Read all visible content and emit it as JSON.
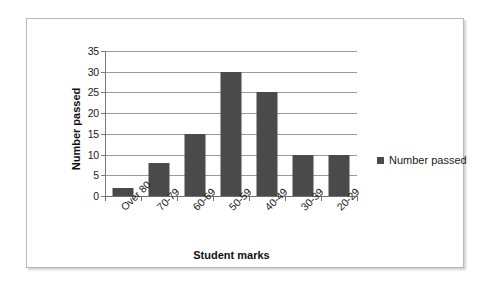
{
  "chart_data": {
    "type": "bar",
    "title": "",
    "xlabel": "Student marks",
    "ylabel": "Number passed",
    "categories": [
      "Over 80",
      "70-79",
      "60-69",
      "50-59",
      "40-49",
      "30-39",
      "20-29"
    ],
    "values": [
      2,
      8,
      15,
      30,
      25,
      10,
      10
    ],
    "series": [
      {
        "name": "Number passed",
        "values": [
          2,
          8,
          15,
          30,
          25,
          10,
          10
        ]
      }
    ],
    "ylim": [
      0,
      35
    ],
    "yticks": [
      0,
      5,
      10,
      15,
      20,
      25,
      30,
      35
    ],
    "ytick_labels": [
      "0",
      "5",
      "10",
      "15",
      "20",
      "25",
      "30",
      "35"
    ],
    "grid": "horizontal",
    "legend": {
      "position": "right",
      "entries": [
        "Number passed"
      ]
    },
    "colors": {
      "bar": "#4a4a4a",
      "gridline": "#9a9a9a",
      "axis": "#6f6f6f",
      "frame": "#b9b9b9",
      "background": "#ffffff",
      "text": "#1a1a1a"
    }
  }
}
